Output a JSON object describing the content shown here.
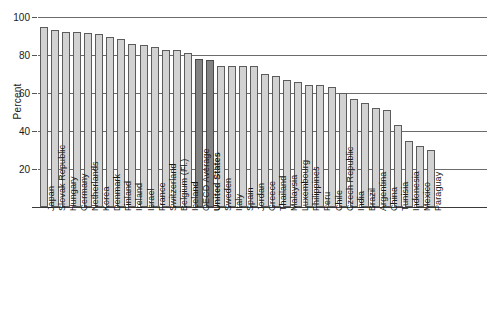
{
  "chart_data": {
    "type": "bar",
    "title": "",
    "xlabel": "",
    "ylabel": "Percent",
    "ylim": [
      0,
      100
    ],
    "yticks": [
      0,
      20,
      40,
      60,
      80,
      100
    ],
    "ytick_labels": [
      "",
      "20",
      "40",
      "60",
      "80",
      "100"
    ],
    "grid": true,
    "legend": "none",
    "highlight_color": "#838383",
    "bar_color": "#d2d2d2",
    "bar_edge_color": "#5c5c5c",
    "highlighted_categories": [
      "OECD Average",
      "United States"
    ],
    "bold_labels": [
      "United States"
    ],
    "categories": [
      "Japan",
      "Slovak Republic",
      "Hungary",
      "Germany",
      "Netherlands",
      "Korea",
      "Denmark",
      "Finland",
      "Ireland",
      "Israel",
      "France",
      "Switzerland",
      "Belgium (Fl.)",
      "Iceland",
      "OECD Average",
      "United States",
      "Sweden",
      "Italy",
      "Spain",
      "Jordan",
      "Greece",
      "Thailand",
      "Malaysia",
      "Luxembourg",
      "Philippines",
      "Peru",
      "Chile",
      "Czech Republic",
      "India",
      "Brazil",
      "Argentina",
      "China",
      "Tunisia",
      "Indonesia",
      "Mexico",
      "Paraguay"
    ],
    "values": [
      95,
      93,
      92,
      92,
      91.5,
      91,
      89.5,
      88.5,
      86,
      85.5,
      84,
      82.5,
      82.5,
      81,
      78,
      77.5,
      74,
      74,
      74,
      74,
      70,
      69,
      67,
      66,
      64,
      64,
      63,
      60,
      57,
      55,
      52,
      51,
      43,
      35,
      32,
      30
    ],
    "values_tail_note": ""
  }
}
